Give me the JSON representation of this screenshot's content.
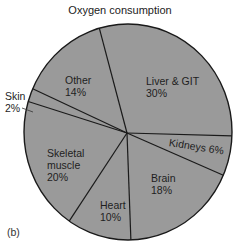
{
  "chart_data": {
    "type": "pie",
    "title": "Oxygen consumption",
    "panel_label": "(b)",
    "categories": [
      "Liver & GIT",
      "Kidneys",
      "Brain",
      "Heart",
      "Skeletal muscle",
      "Skin",
      "Other"
    ],
    "values": [
      30,
      6,
      18,
      10,
      20,
      2,
      14
    ],
    "unit": "%",
    "fill_color": "#9a9a9a",
    "edge_color": "#1a1a1a",
    "start_angle_deg": -16,
    "direction": "clockwise",
    "labels": [
      {
        "name": "Liver & GIT",
        "text1": "Liver & GIT",
        "text2": "30%"
      },
      {
        "name": "Kidneys",
        "text1": "Kidneys 6%",
        "text2": ""
      },
      {
        "name": "Brain",
        "text1": "Brain",
        "text2": "18%"
      },
      {
        "name": "Heart",
        "text1": "Heart",
        "text2": "10%"
      },
      {
        "name": "Skeletal muscle",
        "text1": "Skeletal",
        "text2": "muscle",
        "text3": "20%"
      },
      {
        "name": "Skin",
        "text1": "Skin",
        "text2": "2%"
      },
      {
        "name": "Other",
        "text1": "Other",
        "text2": "14%"
      }
    ]
  }
}
